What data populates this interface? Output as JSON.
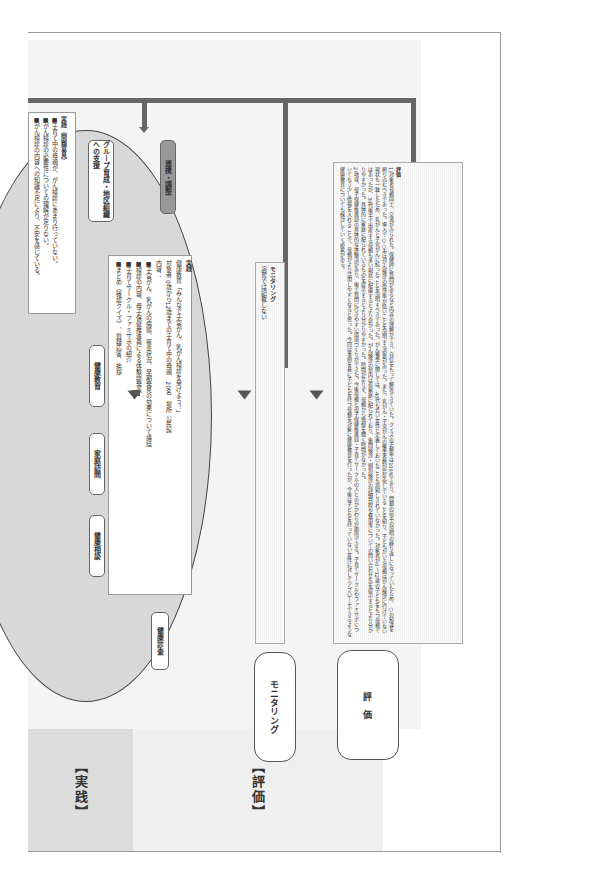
{
  "sections": {
    "practice_label": "【実践】",
    "evaluation_label": "【評価】"
  },
  "problem_box": {
    "title": "実践（問題意見）",
    "items": [
      "■子育て中の母親が、がん検診にあまり行っていない。",
      "■がん検診の必要性についての理解が足りない。",
      "■がん検診の内容への知識不足により、不安を感じている。"
    ]
  },
  "activities": {
    "group_support": "グループ育成・地区組織への支援",
    "coordination": "連携・調整",
    "health_education": "健康教育",
    "home_visit": "家庭訪問",
    "health_consultation": "健康相談",
    "health_checkup": "健康診査"
  },
  "practice_box": {
    "title": "実践",
    "lines": [
      "健康教育「みんなで子宮がん、乳がん検診を受けよう！」",
      "対象者 0歳から12歳までの子育て中の母親　20名　場所 公民館",
      "内容：",
      "■子宮がん、乳がんの病態、罹患状況、早期発見の効果について講話",
      "■検診の内容、母子保健推進員による体験談発表",
      "■子育てサークル・ファミサポの紹介",
      "■まとめ（確認クイズ）、質疑応答、挨拶"
    ]
  },
  "monitoring": {
    "header": "モニタリング",
    "note": "演習では記載しない",
    "box_label": "モニタリング"
  },
  "evaluation": {
    "box_label": "評　価",
    "title": "評価",
    "paragraph1": "1)対象者母親同士、交流がみられた。保健師に質問があるなど内容の理解ができ、自信をもって解答できていた。クイズの正解率は100%であり、問題の前半の説明の繰り返しになっていたため、○の知識を刷り込むべきであった。導入で○○市はがん検診の受診率が低いことを説明する必要があった。また、乳がん・子宮がんの罹患者数が若年化していることを知り、子どもがいる母親はがん検診に行けていない現状も一致したため、乳がんと子宮がんに絞ったことを説明すべきであった。がん罹患に関しては、40代も若い女性と定義しておいたことも周知しきれていなかった。対象者が0〜12歳の子どもをもつ母親ではあったが、30代後半で出産する母親も多い現状に配慮するとより良かった。がん検診の案内は各家庭に配られており、集団検診・個別検診の詳細日程や費用等についての問い合わせ先を提示するとより分かりやすかった。具体的に家庭に配られているものを提示するとより分かりやすかった。時間が足りず、母親から感想を聞く時間がなかった。",
    "paragraph2": "2)地域、母子保健推進員の具体的な体験談があり、後で質問に行きやすい環境づくりができた。今後母親と母子保健推進員・子育てサークルの人とのかかわりが期待できる。子育てサークルやファミサポについてもう少し情報を入れることで、母親がより活用しやすくなると思った。今回は事例を基に子どもを持つ母親を対象に健康教育を行ったが、今後は子どもを持っていない女性に対してアプローチできるような健康教育についても検討していく必要がある。"
  }
}
